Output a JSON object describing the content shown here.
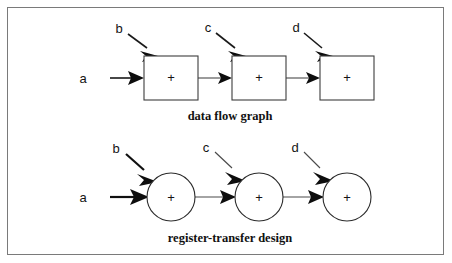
{
  "figure": {
    "background_color": "#ffffff",
    "frame_color": "#7a7a7a",
    "ink_color": "#111111",
    "width": 452,
    "height": 263
  },
  "diagrams": [
    {
      "id": "data-flow-graph",
      "caption": "data flow graph",
      "caption_x": 230,
      "caption_y": 119,
      "node_shape": "square",
      "nodes": [
        {
          "id": "dfg-node-1",
          "label": "+",
          "x": 144,
          "y": 56,
          "w": 54,
          "h": 44
        },
        {
          "id": "dfg-node-2",
          "label": "+",
          "x": 232,
          "y": 56,
          "w": 54,
          "h": 44
        },
        {
          "id": "dfg-node-3",
          "label": "+",
          "x": 320,
          "y": 56,
          "w": 54,
          "h": 44
        }
      ],
      "inputs": [
        {
          "id": "dfg-input-a",
          "label": "a",
          "label_x": 83,
          "label_y": 78,
          "direction": "horizontal",
          "x1": 110,
          "y1": 78,
          "x2": 144,
          "y2": 78,
          "weight": "medium"
        },
        {
          "id": "dfg-input-b",
          "label": "b",
          "label_x": 119,
          "label_y": 33,
          "direction": "diagonal",
          "x1": 128,
          "y1": 34,
          "x2": 157,
          "y2": 56,
          "weight": "medium"
        },
        {
          "id": "dfg-input-c",
          "label": "c",
          "label_x": 208,
          "label_y": 31,
          "direction": "diagonal",
          "x1": 216,
          "y1": 33,
          "x2": 245,
          "y2": 56,
          "weight": "medium"
        },
        {
          "id": "dfg-input-d",
          "label": "d",
          "label_x": 296,
          "label_y": 31,
          "direction": "diagonal",
          "x1": 304,
          "y1": 33,
          "x2": 333,
          "y2": 56,
          "weight": "medium"
        }
      ],
      "edges": [
        {
          "id": "dfg-edge-1-2",
          "from": "dfg-node-1",
          "to": "dfg-node-2",
          "x1": 198,
          "y1": 78,
          "x2": 232,
          "y2": 78,
          "weight": "thin"
        },
        {
          "id": "dfg-edge-2-3",
          "from": "dfg-node-2",
          "to": "dfg-node-3",
          "x1": 286,
          "y1": 78,
          "x2": 320,
          "y2": 78,
          "weight": "thin"
        }
      ]
    },
    {
      "id": "register-transfer-design",
      "caption": "register-transfer design",
      "caption_x": 230,
      "caption_y": 241,
      "node_shape": "circle",
      "nodes": [
        {
          "id": "rtd-node-1",
          "label": "+",
          "cx": 171,
          "cy": 197,
          "r": 24
        },
        {
          "id": "rtd-node-2",
          "label": "+",
          "cx": 259,
          "cy": 197,
          "r": 24
        },
        {
          "id": "rtd-node-3",
          "label": "+",
          "cx": 347,
          "cy": 197,
          "r": 24
        }
      ],
      "inputs": [
        {
          "id": "rtd-input-a",
          "label": "a",
          "label_x": 83,
          "label_y": 201,
          "direction": "horizontal",
          "x1": 110,
          "y1": 197,
          "x2": 147,
          "y2": 197,
          "weight": "thick"
        },
        {
          "id": "rtd-input-b",
          "label": "b",
          "label_x": 116,
          "label_y": 152,
          "direction": "diagonal",
          "x1": 126,
          "y1": 154,
          "x2": 156,
          "y2": 180,
          "weight": "thick"
        },
        {
          "id": "rtd-input-c",
          "label": "c",
          "label_x": 206,
          "label_y": 151,
          "direction": "diagonal",
          "x1": 215,
          "y1": 152,
          "x2": 244,
          "y2": 180,
          "weight": "thin"
        },
        {
          "id": "rtd-input-d",
          "label": "d",
          "label_x": 295,
          "label_y": 151,
          "direction": "diagonal",
          "x1": 304,
          "y1": 152,
          "x2": 332,
          "y2": 180,
          "weight": "thin"
        }
      ],
      "edges": [
        {
          "id": "rtd-edge-1-2",
          "from": "rtd-node-1",
          "to": "rtd-node-2",
          "x1": 195,
          "y1": 197,
          "x2": 235,
          "y2": 197,
          "weight": "thin"
        },
        {
          "id": "rtd-edge-2-3",
          "from": "rtd-node-2",
          "to": "rtd-node-3",
          "x1": 283,
          "y1": 197,
          "x2": 323,
          "y2": 197,
          "weight": "thin"
        }
      ]
    }
  ]
}
